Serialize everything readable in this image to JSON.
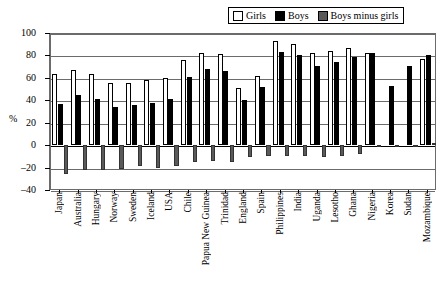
{
  "legend": {
    "items": [
      {
        "label": "Girls",
        "color": "#ffffff",
        "icon": "legend-swatch-girls"
      },
      {
        "label": "Boys",
        "color": "#000000",
        "icon": "legend-swatch-boys"
      },
      {
        "label": "Boys minus girls",
        "color": "#595959",
        "icon": "legend-swatch-difference"
      }
    ]
  },
  "chart_data": {
    "type": "bar",
    "title": "",
    "subtitle": "",
    "xlabel": "",
    "ylabel": "%",
    "ylim": [
      -40,
      100
    ],
    "yticks": [
      100,
      80,
      60,
      40,
      20,
      0,
      -20,
      -40
    ],
    "grid": true,
    "legend_position": "top-right",
    "categories": [
      "Japan",
      "Australia",
      "Hungary",
      "Norway",
      "Sweden",
      "Iceland",
      "USA",
      "Chile",
      "Papua New Guinea",
      "Trinidad",
      "England",
      "Spain",
      "Philippines",
      "India",
      "Uganda",
      "Lesotho",
      "Ghana",
      "Nigeria",
      "Korea",
      "Sudan",
      "Mozambique"
    ],
    "series": [
      {
        "name": "Girls",
        "color": "#ffffff",
        "values": [
          63,
          67,
          63,
          55,
          55,
          58,
          60,
          76,
          82,
          81,
          51,
          62,
          93,
          90,
          82,
          84,
          87,
          82,
          null,
          null,
          77
        ]
      },
      {
        "name": "Boys",
        "color": "#000000",
        "values": [
          37,
          45,
          41,
          34,
          36,
          38,
          41,
          61,
          68,
          66,
          40,
          52,
          83,
          80,
          71,
          74,
          79,
          82,
          53,
          71,
          80
        ]
      },
      {
        "name": "Boys minus girls",
        "color": "#595959",
        "values": [
          -26,
          -22,
          -22,
          -21,
          -19,
          -20,
          -19,
          -15,
          -14,
          -15,
          -11,
          -10,
          -10,
          -10,
          -11,
          -10,
          -8,
          -1,
          0,
          0,
          2
        ]
      }
    ]
  }
}
